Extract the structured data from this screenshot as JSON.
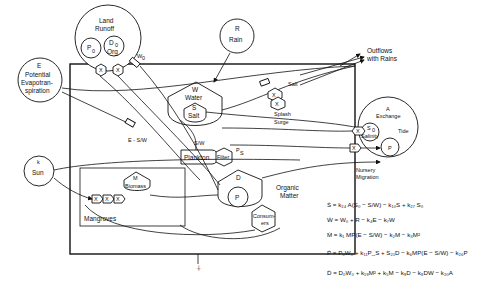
{
  "diagram": {
    "sources": {
      "land_runoff": {
        "label_line1": "Land",
        "label_line2": "Runoff",
        "p0": "P",
        "p0_sub": "0",
        "d0": "D",
        "d0_sub": "0",
        "d0_org": "Org"
      },
      "rain": {
        "symbol": "R",
        "label": "Rain"
      },
      "evapotranspiration": {
        "symbol": "E",
        "line1": "Potential",
        "line2": "Evapotran-",
        "line3": "spiration"
      },
      "sun": {
        "symbol": "k",
        "label": "Sun"
      },
      "tide": {
        "exchange_symbol": "A",
        "exchange_label": "Exchange",
        "salinity_symbol": "S",
        "salinity_sub": "0",
        "salinity_label": "Salinity",
        "tide_label": "Tide",
        "p_label": "P"
      }
    },
    "storages": {
      "water": {
        "symbol": "W",
        "label": "Water"
      },
      "salt": {
        "symbol": "S",
        "label": "Salt"
      },
      "plankton": {
        "label": "Plankton"
      },
      "filter": {
        "label": "Filter"
      },
      "organic_matter": {
        "d_label": "D",
        "p_label": "P",
        "label_line1": "Organic",
        "label_line2": "Matter"
      },
      "consumers": {
        "line1": "Consum-",
        "line2": "ers"
      },
      "mangroves": {
        "label": "Mangroves",
        "biomass_symbol": "M",
        "biomass_label": "Biomass"
      }
    },
    "flow_labels": {
      "w0": "W",
      "w0_sub": "0",
      "salt": "Salt",
      "splash": "Splash",
      "surge": "Surge",
      "ps": "P",
      "ps_sub": "S",
      "evap_term": "E - S/W",
      "s_over_w": "S/W",
      "outflows_line1": "Outflows",
      "outflows_line2": "with Rains",
      "nursery_line1": "Nursery",
      "nursery_line2": "Migration",
      "multiplier": "X"
    },
    "equations": [
      "Ṡ = k₂₄ A(S₀ − S/W) − k₁₀S + k₂₇ S₀",
      "Ẇ = W₀ + R − k₄E − k₇W",
      "Ṁ = k₁ MP(E − S/W) − k₂M − k₃M²",
      "Ṗ = P₀W₀ + k₁₁P_S + S₂₁D − k₆MP(E − S/W) − k₂₆P",
      "Ḋ = D₀W₀ + k₁₉M² + k₅M − k₉D − k₈DW − k₂₀A"
    ]
  }
}
